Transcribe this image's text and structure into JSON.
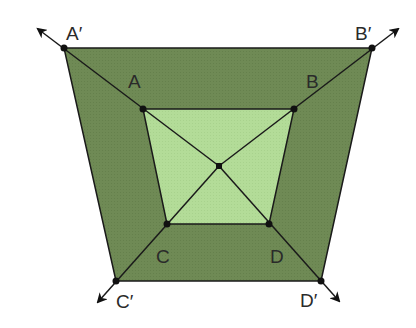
{
  "diagram": {
    "title": "",
    "colors": {
      "outer_fill": "#6f8a55",
      "inner_fill": "#b3dc98",
      "stroke": "#1a1a1a",
      "background": "#ffffff"
    },
    "points": {
      "A_prime": {
        "label": "A′",
        "x": 64,
        "y": 48
      },
      "B_prime": {
        "label": "B′",
        "x": 372,
        "y": 48
      },
      "C_prime": {
        "label": "C′",
        "x": 116,
        "y": 281
      },
      "D_prime": {
        "label": "D′",
        "x": 321,
        "y": 281
      },
      "A": {
        "label": "A",
        "x": 143,
        "y": 109
      },
      "B": {
        "label": "B",
        "x": 294,
        "y": 109
      },
      "C": {
        "label": "C",
        "x": 167,
        "y": 224
      },
      "D": {
        "label": "D",
        "x": 269,
        "y": 224
      },
      "O": {
        "label": "",
        "x": 219,
        "y": 166
      }
    },
    "labels": {
      "A_prime": "A′",
      "B_prime": "B′",
      "C_prime": "C′",
      "D_prime": "D′",
      "A": "A",
      "B": "B",
      "C": "C",
      "D": "D"
    },
    "shapes": [
      {
        "name": "outer-trapezoid",
        "vertices": [
          "A′",
          "B′",
          "D′",
          "C′"
        ]
      },
      {
        "name": "inner-trapezoid",
        "vertices": [
          "A",
          "B",
          "D",
          "C"
        ]
      }
    ],
    "rays": [
      {
        "from": "O",
        "through": "A",
        "to": "A′",
        "arrow_tip": [
          36,
          27
        ]
      },
      {
        "from": "O",
        "through": "B",
        "to": "B′",
        "arrow_tip": [
          400,
          27
        ]
      },
      {
        "from": "O",
        "through": "C",
        "to": "C′",
        "arrow_tip": [
          96,
          304
        ]
      },
      {
        "from": "O",
        "through": "D",
        "to": "D′",
        "arrow_tip": [
          341,
          303
        ]
      }
    ]
  }
}
